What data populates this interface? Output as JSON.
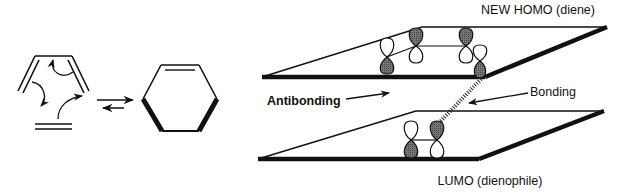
{
  "figure": {
    "type": "diels-alder-frontier-orbital-diagram",
    "reaction": {
      "reactants": [
        "diene",
        "dienophile"
      ],
      "product": "cyclohexene",
      "arrow_type": "equilibrium"
    },
    "labels": {
      "homo": "NEW HOMO (diene)",
      "lumo": "LUMO (dienophile)",
      "antibonding": "Antibonding",
      "bonding": "Bonding"
    },
    "homo_plane": {
      "orbitals": [
        {
          "position": 1,
          "top_lobe": "unshaded",
          "bottom_lobe": "shaded"
        },
        {
          "position": 2,
          "top_lobe": "shaded",
          "bottom_lobe": "unshaded"
        },
        {
          "position": 3,
          "top_lobe": "shaded",
          "bottom_lobe": "unshaded"
        },
        {
          "position": 4,
          "top_lobe": "unshaded",
          "bottom_lobe": "shaded"
        }
      ]
    },
    "lumo_plane": {
      "orbitals": [
        {
          "position": 1,
          "top_lobe": "unshaded",
          "bottom_lobe": "shaded"
        },
        {
          "position": 2,
          "top_lobe": "shaded",
          "bottom_lobe": "unshaded"
        }
      ]
    },
    "colors": {
      "ink": "#111111",
      "shaded_lobe": "#6a6a6a",
      "background": "#ffffff"
    }
  }
}
